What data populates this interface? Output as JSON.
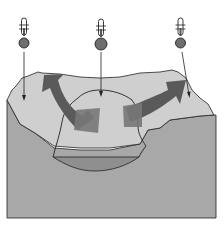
{
  "diagram": {
    "title": "",
    "colors": {
      "background": "#ffffff",
      "ground": "#a8a8a8",
      "air_mass": "#cfcfcf",
      "basin": "#8f8f8f",
      "arrow_dark": "#5a5a5a",
      "arrow_mid": "#777777",
      "outline": "#222222",
      "thermometer_bulb": "#6e6e6e"
    },
    "thermometers": [
      {
        "position": "left",
        "icon": "thermometer-icon"
      },
      {
        "position": "center",
        "icon": "thermometer-icon"
      },
      {
        "position": "right",
        "icon": "thermometer-icon"
      }
    ],
    "flow_arrows": [
      {
        "direction": "center-to-left",
        "icon": "curved-arrow-icon"
      },
      {
        "direction": "center-to-right",
        "icon": "curved-arrow-icon"
      }
    ]
  }
}
